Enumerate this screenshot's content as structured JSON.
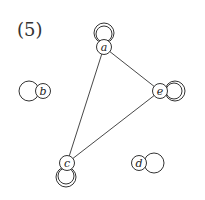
{
  "figure": {
    "label": "(5)"
  },
  "graph": {
    "nodes": [
      {
        "id": "a",
        "label": "a",
        "x": 104,
        "y": 47,
        "loops": 2,
        "loop_dir": "up"
      },
      {
        "id": "b",
        "label": "b",
        "x": 43,
        "y": 91,
        "loops": 1,
        "loop_dir": "left"
      },
      {
        "id": "c",
        "label": "c",
        "x": 67,
        "y": 163,
        "loops": 2,
        "loop_dir": "down"
      },
      {
        "id": "d",
        "label": "d",
        "x": 139,
        "y": 163,
        "loops": 1,
        "loop_dir": "right"
      },
      {
        "id": "e",
        "label": "e",
        "x": 160,
        "y": 91,
        "loops": 2,
        "loop_dir": "right"
      }
    ],
    "edges": [
      {
        "from": "a",
        "to": "e"
      },
      {
        "from": "a",
        "to": "c"
      },
      {
        "from": "c",
        "to": "e"
      }
    ]
  }
}
